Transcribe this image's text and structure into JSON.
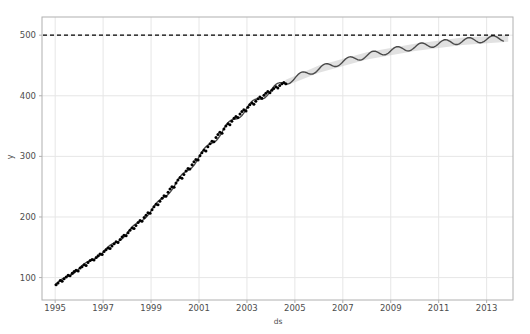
{
  "chart_data": {
    "type": "line",
    "title": "",
    "xlabel": "ds",
    "ylabel": "y",
    "xlim": [
      1994.45,
      2014.1
    ],
    "ylim": [
      63,
      530
    ],
    "xticks": [
      1995,
      1997,
      1999,
      2001,
      2003,
      2005,
      2007,
      2009,
      2011,
      2013
    ],
    "xtick_labels": [
      "1995",
      "1997",
      "1999",
      "2001",
      "2003",
      "2005",
      "2007",
      "2009",
      "2011",
      "2013"
    ],
    "yticks": [
      100,
      200,
      300,
      400,
      500
    ],
    "ytick_labels": [
      "100",
      "200",
      "300",
      "400",
      "500"
    ],
    "grid": true,
    "legend": "none",
    "colors": {
      "history_points": "#000000",
      "forecast_line": "#4a4a4a",
      "uncertainty_band": "#c8c8c8",
      "cap_line": "#000000",
      "grid": "#e6e6e6",
      "axis_border": "#b0b0b0",
      "background": "#ffffff",
      "tick_text": "#4d4d4d"
    },
    "annotations": [
      {
        "name": "cap-line",
        "style": "dashed",
        "y": 500,
        "label": "cap = 500"
      }
    ],
    "series": [
      {
        "name": "history",
        "style": "points",
        "x": [
          1995.04,
          1995.12,
          1995.21,
          1995.29,
          1995.37,
          1995.46,
          1995.54,
          1995.62,
          1995.71,
          1995.79,
          1995.87,
          1995.96,
          1996.04,
          1996.12,
          1996.21,
          1996.29,
          1996.37,
          1996.46,
          1996.54,
          1996.62,
          1996.71,
          1996.79,
          1996.87,
          1996.96,
          1997.04,
          1997.12,
          1997.21,
          1997.29,
          1997.37,
          1997.46,
          1997.54,
          1997.62,
          1997.71,
          1997.79,
          1997.87,
          1997.96,
          1998.04,
          1998.12,
          1998.21,
          1998.29,
          1998.37,
          1998.46,
          1998.54,
          1998.62,
          1998.71,
          1998.79,
          1998.87,
          1998.96,
          1999.04,
          1999.12,
          1999.21,
          1999.29,
          1999.37,
          1999.46,
          1999.54,
          1999.62,
          1999.71,
          1999.79,
          1999.87,
          1999.96,
          2000.04,
          2000.12,
          2000.21,
          2000.29,
          2000.37,
          2000.46,
          2000.54,
          2000.62,
          2000.71,
          2000.79,
          2000.87,
          2000.96,
          2001.04,
          2001.12,
          2001.21,
          2001.29,
          2001.37,
          2001.46,
          2001.54,
          2001.62,
          2001.71,
          2001.79,
          2001.87,
          2001.96,
          2002.04,
          2002.12,
          2002.21,
          2002.29,
          2002.37,
          2002.46,
          2002.54,
          2002.62,
          2002.71,
          2002.79,
          2002.87,
          2002.96,
          2003.04,
          2003.12,
          2003.21,
          2003.29,
          2003.37,
          2003.46,
          2003.54,
          2003.62,
          2003.71,
          2003.79,
          2003.87,
          2003.96,
          2004.04,
          2004.12,
          2004.21,
          2004.29,
          2004.37,
          2004.46,
          2004.54,
          2004.62
        ],
        "y": [
          88,
          91,
          95,
          94,
          98,
          101,
          104,
          103,
          107,
          110,
          112,
          111,
          116,
          118,
          121,
          120,
          125,
          128,
          130,
          129,
          133,
          136,
          139,
          138,
          143,
          146,
          149,
          148,
          152,
          156,
          159,
          158,
          163,
          167,
          170,
          169,
          174,
          178,
          182,
          181,
          186,
          191,
          194,
          193,
          199,
          203,
          207,
          206,
          212,
          217,
          221,
          220,
          226,
          231,
          235,
          234,
          241,
          246,
          250,
          249,
          256,
          261,
          265,
          264,
          270,
          276,
          280,
          279,
          286,
          291,
          295,
          294,
          301,
          306,
          310,
          309,
          316,
          321,
          325,
          324,
          331,
          336,
          340,
          338,
          345,
          350,
          354,
          352,
          358,
          363,
          366,
          364,
          370,
          374,
          377,
          375,
          381,
          385,
          388,
          386,
          391,
          395,
          398,
          396,
          401,
          404,
          407,
          405,
          409,
          412,
          415,
          413,
          417,
          420,
          422,
          420
        ]
      },
      {
        "name": "yhat",
        "style": "line",
        "x": [
          1995.0,
          1996.0,
          1997.0,
          1998.0,
          1999.0,
          2000.0,
          2001.0,
          2002.0,
          2003.0,
          2004.0,
          2004.5,
          2005.0,
          2005.5,
          2006.0,
          2006.5,
          2007.0,
          2007.5,
          2008.0,
          2008.5,
          2009.0,
          2009.5,
          2010.0,
          2010.5,
          2011.0,
          2011.5,
          2012.0,
          2012.5,
          2013.0,
          2013.5,
          2013.9
        ],
        "y": [
          88,
          115,
          142,
          173,
          210,
          253,
          299,
          343,
          380,
          409,
          421,
          429,
          438,
          444,
          451,
          456,
          462,
          466,
          471,
          474,
          478,
          480,
          484,
          486,
          489,
          490,
          492,
          493,
          495,
          495
        ]
      },
      {
        "name": "yhat_upper",
        "style": "band-upper",
        "x": [
          2004.6,
          2006.0,
          2008.0,
          2010.0,
          2012.0,
          2013.9
        ],
        "y": [
          426,
          450,
          472,
          486,
          496,
          500
        ]
      },
      {
        "name": "yhat_lower",
        "style": "band-lower",
        "x": [
          2004.6,
          2006.0,
          2008.0,
          2010.0,
          2012.0,
          2013.9
        ],
        "y": [
          416,
          438,
          460,
          474,
          484,
          489
        ]
      }
    ]
  },
  "axes": {
    "xlabel": "ds",
    "ylabel": "y"
  }
}
